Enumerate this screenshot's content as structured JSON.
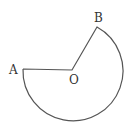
{
  "figure": {
    "type": "circular-sector",
    "stroke_color": "#555555",
    "points": {
      "A": {
        "label": "A"
      },
      "O": {
        "label": "O"
      },
      "B": {
        "label": "B"
      }
    }
  }
}
